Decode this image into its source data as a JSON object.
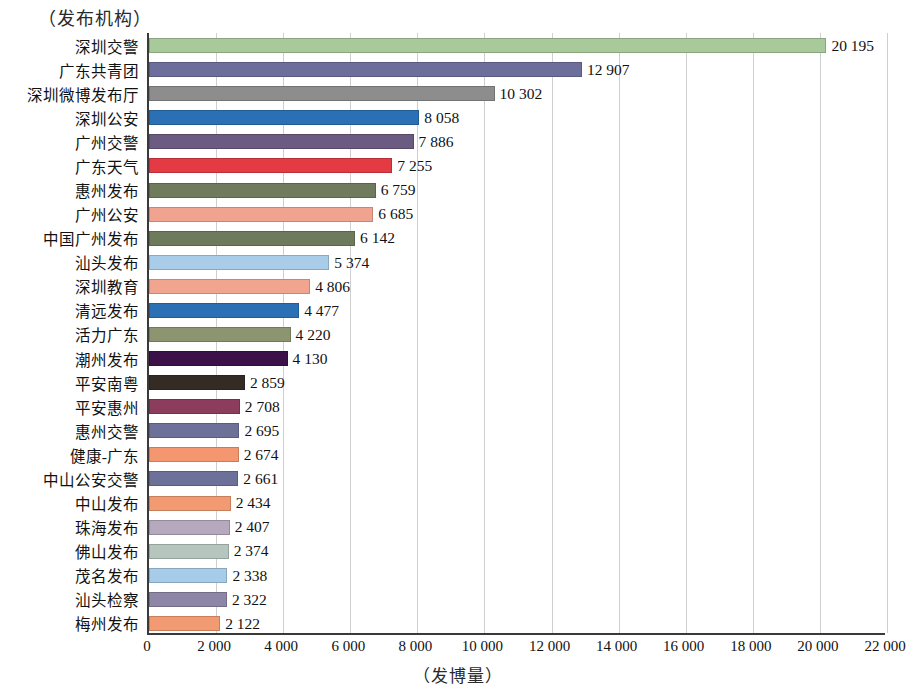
{
  "chart_data": {
    "type": "bar",
    "orientation": "horizontal",
    "title": "",
    "ylabel": "（发布机构）",
    "xlabel": "（发博量）",
    "xlim": [
      0,
      22000
    ],
    "xticks": [
      0,
      2000,
      4000,
      6000,
      8000,
      10000,
      12000,
      14000,
      16000,
      18000,
      20000,
      22000
    ],
    "xtick_labels": [
      "0",
      "2 000",
      "4 000",
      "6 000",
      "8 000",
      "10 000",
      "12 000",
      "14 000",
      "16 000",
      "18 000",
      "20 000",
      "22 000"
    ],
    "grid": "vertical",
    "legend": "none",
    "categories": [
      "深圳交警",
      "广东共青团",
      "深圳微博发布厅",
      "深圳公安",
      "广州交警",
      "广东天气",
      "惠州发布",
      "广州公安",
      "中国广州发布",
      "汕头发布",
      "深圳教育",
      "清远发布",
      "活力广东",
      "潮州发布",
      "平安南粤",
      "平安惠州",
      "惠州交警",
      "健康-广东",
      "中山公安交警",
      "中山发布",
      "珠海发布",
      "佛山发布",
      "茂名发布",
      "汕头检察",
      "梅州发布"
    ],
    "values": [
      20195,
      12907,
      10302,
      8058,
      7886,
      7255,
      6759,
      6685,
      6142,
      5374,
      4806,
      4477,
      4220,
      4130,
      2859,
      2708,
      2695,
      2674,
      2661,
      2434,
      2407,
      2374,
      2338,
      2322,
      2122
    ],
    "value_labels": [
      "20 195",
      "12 907",
      "10 302",
      "8 058",
      "7 886",
      "7 255",
      "6 759",
      "6 685",
      "6 142",
      "5 374",
      "4 806",
      "4 477",
      "4 220",
      "4 130",
      "2 859",
      "2 708",
      "2 695",
      "2 674",
      "2 661",
      "2 434",
      "2 407",
      "2 374",
      "2 338",
      "2 322",
      "2 122"
    ],
    "colors": [
      "#a8c99a",
      "#6d6e9c",
      "#8d8d8d",
      "#2b70b4",
      "#6b5a82",
      "#e33a44",
      "#6f7b5c",
      "#f0a490",
      "#6e7a5c",
      "#a9cde9",
      "#f2a58e",
      "#2b70b4",
      "#8c9570",
      "#3c1048",
      "#342b25",
      "#8c3c5c",
      "#6d7199",
      "#f4966f",
      "#6d7199",
      "#f29a71",
      "#b6a9be",
      "#b6c5bd",
      "#a6cce9",
      "#8d86a6",
      "#f29a71"
    ]
  }
}
